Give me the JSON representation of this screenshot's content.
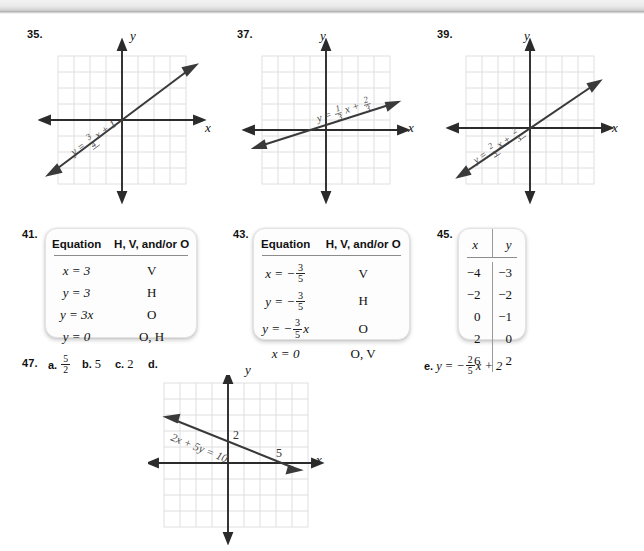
{
  "page": {
    "background": "#ffffff",
    "scan_edge_color": "#bdbdbd"
  },
  "exercises": [
    {
      "number": "35."
    },
    {
      "number": "37."
    },
    {
      "number": "39."
    },
    {
      "number": "41."
    },
    {
      "number": "43."
    },
    {
      "number": "45."
    },
    {
      "number": "47."
    }
  ],
  "graphs": [
    {
      "id": "graph-35",
      "number": "35.",
      "x_axis_label": "x",
      "y_axis_label": "y",
      "equation_label": "y = 3/4 x + 1",
      "equation_parts": {
        "lhs": "y =",
        "num": "3",
        "den": "4",
        "var": "x + 1"
      },
      "line": {
        "slope": 0.75,
        "intercept": 1
      },
      "grid": {
        "cols": 8,
        "rows": 8,
        "color": "#dcdcdc"
      }
    },
    {
      "id": "graph-37",
      "number": "37.",
      "x_axis_label": "x",
      "y_axis_label": "y",
      "equation_label": "y = 1/3 x + 2/3",
      "equation_parts": {
        "lhs": "y =",
        "num": "1",
        "den": "3",
        "var": "x +",
        "num2": "2",
        "den2": "3"
      },
      "line": {
        "slope": 0.33,
        "intercept": 0.67
      },
      "grid": {
        "cols": 8,
        "rows": 8,
        "color": "#dcdcdc"
      }
    },
    {
      "id": "graph-39",
      "number": "39.",
      "x_axis_label": "x",
      "y_axis_label": "y",
      "equation_label": "y = 2/3 x + 2/3",
      "equation_parts": {
        "lhs": "y =",
        "num": "2",
        "den": "3",
        "var": "x +",
        "num2": "2",
        "den2": "3"
      },
      "line": {
        "slope": 0.67,
        "intercept": 0.67
      },
      "grid": {
        "cols": 8,
        "rows": 8,
        "color": "#dcdcdc"
      }
    },
    {
      "id": "graph-47d",
      "number": "d.",
      "x_axis_label": "x",
      "y_axis_label": "y",
      "equation_label": "2x + 5y = 10",
      "intercept_label_y": "2",
      "intercept_label_x": "5",
      "line": {
        "slope": -0.4,
        "intercept": 2
      },
      "grid": {
        "cols": 9,
        "rows": 9,
        "color": "#dcdcdc"
      }
    }
  ],
  "table41": {
    "number": "41.",
    "headers": [
      "Equation",
      "H, V, and/or O"
    ],
    "rows": [
      {
        "equation": "x = 3",
        "answer": "V"
      },
      {
        "equation": "y = 3",
        "answer": "H"
      },
      {
        "equation": "y = 3x",
        "answer": "O"
      },
      {
        "equation": "y = 0",
        "answer": "O, H"
      }
    ]
  },
  "table43": {
    "number": "43.",
    "headers": [
      "Equation",
      "H, V, and/or O"
    ],
    "rows": [
      {
        "equation": "x = -3/5",
        "lhs": "x = −",
        "num": "3",
        "den": "5",
        "tail": "",
        "answer": "V"
      },
      {
        "equation": "y = -3/5",
        "lhs": "y = −",
        "num": "3",
        "den": "5",
        "tail": "",
        "answer": "H"
      },
      {
        "equation": "y = -3/5 x",
        "lhs": "y = −",
        "num": "3",
        "den": "5",
        "tail": "x",
        "answer": "O"
      },
      {
        "equation": "x = 0",
        "lhs": "x = 0",
        "num": "",
        "den": "",
        "tail": "",
        "answer": "O, V"
      }
    ]
  },
  "table45": {
    "number": "45.",
    "headers": [
      "x",
      "y"
    ],
    "rows": [
      {
        "x": "−4",
        "y": "−3"
      },
      {
        "x": "−2",
        "y": "−2"
      },
      {
        "x": "0",
        "y": "−1"
      },
      {
        "x": "2",
        "y": "0"
      },
      {
        "x": "6",
        "y": "2"
      }
    ]
  },
  "answers47": {
    "number": "47.",
    "a_letter": "a.",
    "a_num": "5",
    "a_den": "2",
    "b_letter": "b.",
    "b_value": "5",
    "c_letter": "c.",
    "c_value": "2",
    "d_letter": "d.",
    "e_letter": "e.",
    "e_lhs": "y = −",
    "e_num": "2",
    "e_den": "5",
    "e_tail": "x + 2"
  }
}
